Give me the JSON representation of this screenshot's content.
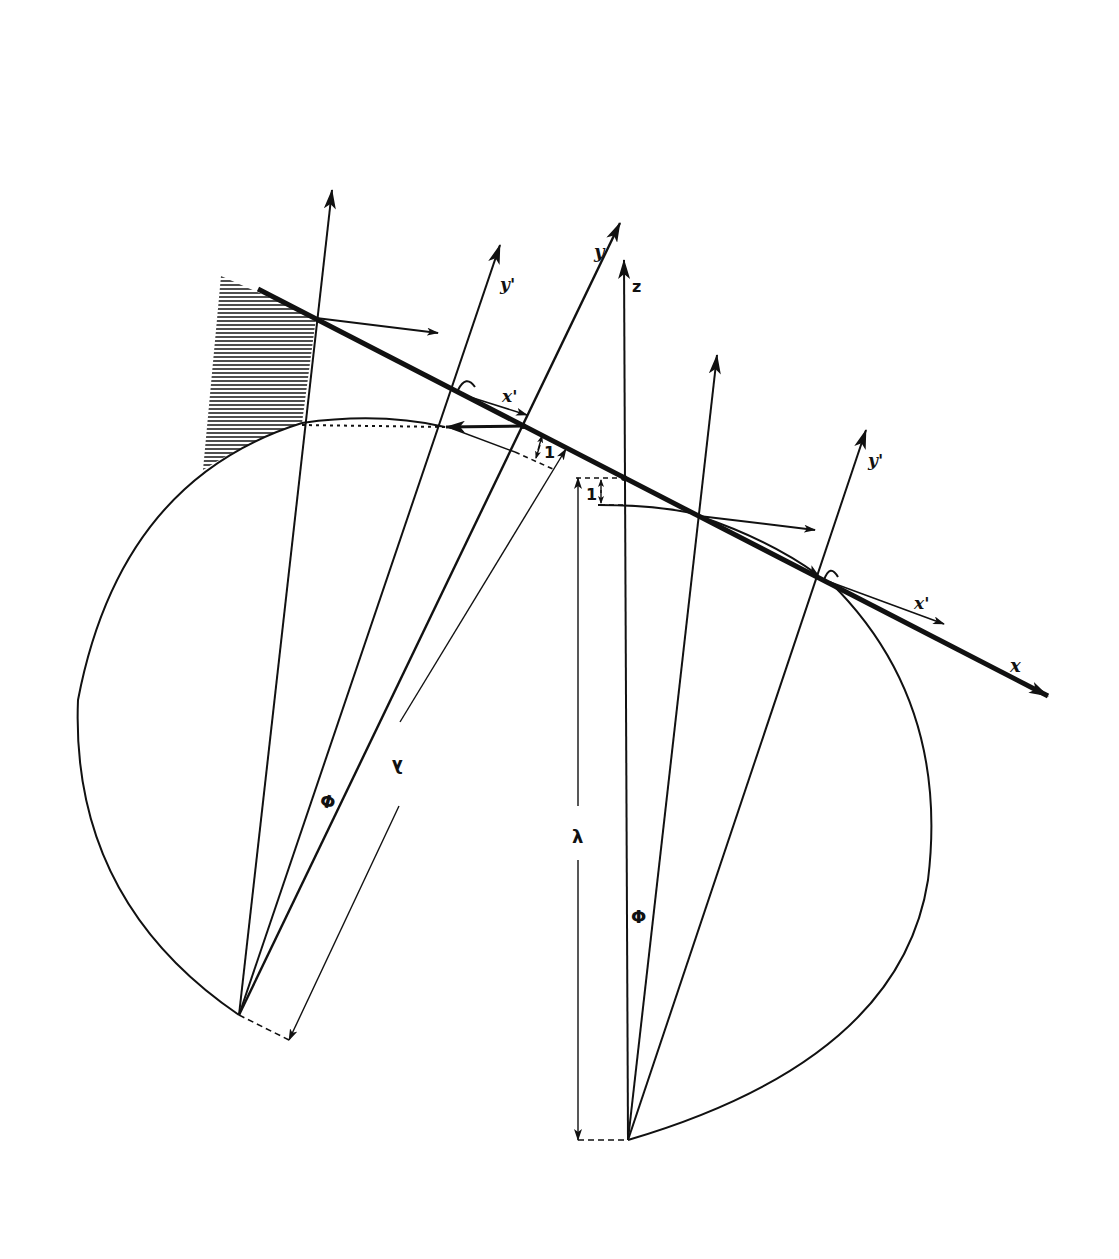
{
  "diagram": {
    "colors": {
      "ink": "#111111",
      "background": "#ffffff",
      "hatch": "#222222"
    },
    "labels": {
      "x_axis": "x",
      "y_axis": "y",
      "z_axis": "z",
      "x_prime_1": "x'",
      "y_prime_1": "y'",
      "x_prime_2": "x'",
      "y_prime_2": "y'",
      "unit_left": "1",
      "unit_right": "1",
      "lambda_left": "λ",
      "lambda_right": "λ",
      "phi_left": "Φ",
      "phi_right": "Φ"
    }
  }
}
